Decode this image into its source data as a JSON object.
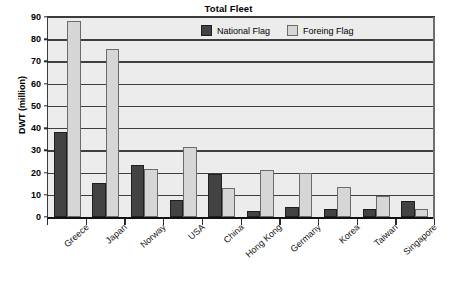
{
  "chart_data": {
    "type": "bar",
    "title": "Total Fleet",
    "xlabel": "",
    "ylabel": "DWT (million)",
    "ylim": [
      0,
      90
    ],
    "ytick_step": 10,
    "yticks": [
      90,
      80,
      70,
      60,
      50,
      40,
      30,
      20,
      10,
      0
    ],
    "grid": true,
    "legend_position": "top-center-inside",
    "categories": [
      "Greece",
      "Japan",
      "Norway",
      "USA",
      "China",
      "Hong Kong",
      "Germany",
      "Korea",
      "Taiwan",
      "Singapore"
    ],
    "series": [
      {
        "name": "National Flag",
        "color": "#434343",
        "values": [
          38.2,
          15.2,
          23.5,
          7.5,
          19.5,
          2.7,
          4.3,
          3.8,
          3.5,
          7.3
        ]
      },
      {
        "name": "Foreing Flag",
        "color": "#d6d6d6",
        "values": [
          88.0,
          75.5,
          21.5,
          31.5,
          13.0,
          21.2,
          20.0,
          13.5,
          9.5,
          3.5
        ]
      }
    ]
  },
  "legend": {
    "items": [
      {
        "label": "National Flag",
        "swatch": "national"
      },
      {
        "label": "Foreing Flag",
        "swatch": "foreign"
      }
    ]
  },
  "colors": {
    "national_flag": "#434343",
    "foreing_flag": "#d6d6d6",
    "plot_background": "#ececec",
    "gridline": "#3f3f3f",
    "axis": "#111111"
  }
}
